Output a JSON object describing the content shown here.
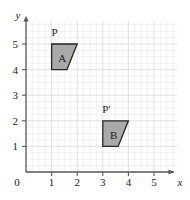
{
  "figure": {
    "background_color": "#ffffff",
    "grid": {
      "minor_color": "#e9e9ef",
      "major_color": "#dcdce6",
      "minor_per_unit": 4,
      "x_range": [
        0,
        5.9
      ],
      "y_range": [
        0,
        5.9
      ],
      "show_grid": true
    },
    "axes": {
      "line_color": "#5a5a5a",
      "x_label": "x",
      "y_label": "y",
      "origin_label": "0",
      "x_ticks": [
        "1",
        "2",
        "3",
        "4",
        "5"
      ],
      "y_ticks": [
        "1",
        "2",
        "3",
        "4",
        "5"
      ],
      "x_tick_values": [
        1,
        2,
        3,
        4,
        5
      ],
      "y_tick_values": [
        1,
        2,
        3,
        4,
        5
      ],
      "arrowheads": true
    },
    "shapes": [
      {
        "name": "A",
        "label": "A",
        "label_point": [
          1.42,
          4.45
        ],
        "vertex_label": "P",
        "vertex_label_point": [
          1.12,
          5.48
        ],
        "vertices": [
          [
            1,
            5
          ],
          [
            2,
            5
          ],
          [
            1.6,
            4
          ],
          [
            1,
            4
          ]
        ],
        "fill_color": "#a9a9a9",
        "stroke_color": "#262626"
      },
      {
        "name": "B",
        "label": "B",
        "label_point": [
          3.42,
          1.45
        ],
        "vertex_label": "P'",
        "vertex_label_point": [
          3.14,
          2.48
        ],
        "vertices": [
          [
            3,
            2
          ],
          [
            4,
            2
          ],
          [
            3.6,
            1
          ],
          [
            3,
            1
          ]
        ],
        "fill_color": "#a9a9a9",
        "stroke_color": "#262626"
      }
    ]
  }
}
